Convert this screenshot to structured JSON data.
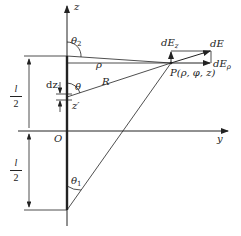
{
  "diagram": {
    "axes": {
      "z_label": "z",
      "y_label": "y",
      "origin_label": "O"
    },
    "labels": {
      "theta2": "θ",
      "theta2_sub": "2",
      "theta1": "θ",
      "theta1_sub": "1",
      "theta": "θ",
      "rho": "ρ",
      "R": "R",
      "dz": "dz",
      "dz_sub": "′",
      "zprime": "z′",
      "point_P": "P(ρ, φ, z)",
      "dE": "dE",
      "dEz": "dE",
      "dEz_sub": "z",
      "dErho": "dE",
      "dErho_sub": "ρ",
      "half_length_top_num": "l",
      "half_length_top_den": "2",
      "half_length_bottom_num": "l",
      "half_length_bottom_den": "2"
    },
    "colors": {
      "stroke": "#222222",
      "background": "#ffffff"
    }
  }
}
